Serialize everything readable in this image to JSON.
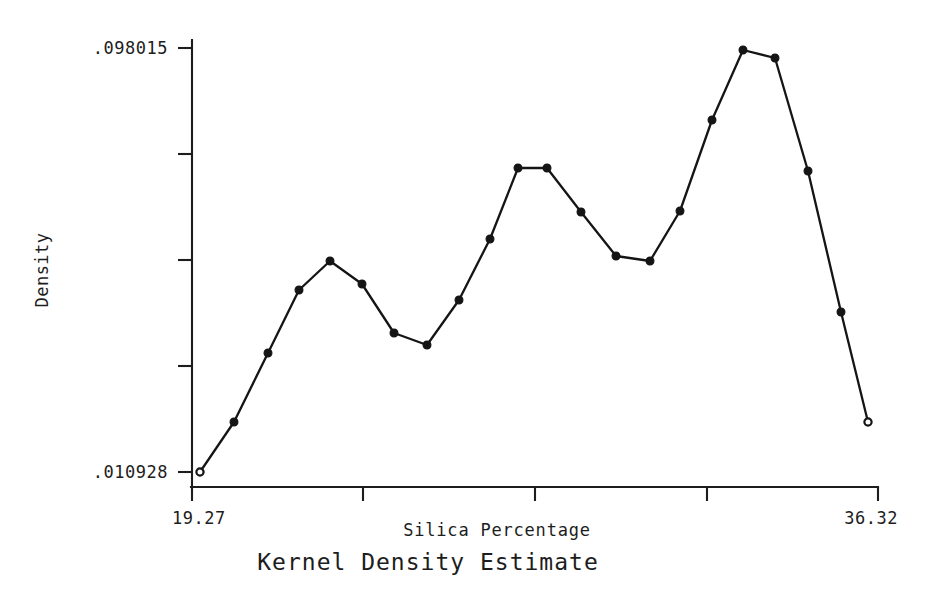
{
  "chart_data": {
    "type": "line",
    "title": "Kernel Density Estimate",
    "xlabel": "Silica Percentage",
    "ylabel": "Density",
    "xlim": [
      19.27,
      36.32
    ],
    "ylim": [
      0.010928,
      0.098015
    ],
    "x_tick_labels": [
      "19.27",
      "36.32"
    ],
    "y_tick_labels": [
      ".098015",
      ".010928"
    ],
    "x_tick_count": 5,
    "y_tick_count": 5,
    "grid": false,
    "legend": null,
    "marker": "filled-circle",
    "x": [
      19.27,
      20.11,
      20.96,
      21.73,
      22.5,
      23.3,
      24.07,
      24.89,
      25.67,
      26.46,
      27.36,
      28.11,
      28.83,
      29.63,
      30.48,
      31.28,
      32.11,
      32.92,
      33.7,
      34.5,
      35.27,
      36.32
    ],
    "y": [
      0.010928,
      0.021,
      0.035,
      0.048,
      0.054,
      0.048,
      0.039,
      0.036,
      0.0455,
      0.0575,
      0.07,
      0.07,
      0.0605,
      0.0555,
      0.0545,
      0.0605,
      0.0792,
      0.098,
      0.0963,
      0.0683,
      0.0444,
      0.0213
    ],
    "points_px": [
      [
        200,
        472
      ],
      [
        234,
        422
      ],
      [
        268,
        353
      ],
      [
        299,
        290
      ],
      [
        330,
        261
      ],
      [
        362,
        284
      ],
      [
        394,
        333
      ],
      [
        427,
        345
      ],
      [
        459,
        300
      ],
      [
        490,
        239
      ],
      [
        518,
        168
      ],
      [
        547,
        168
      ],
      [
        581,
        212
      ],
      [
        616,
        256
      ],
      [
        650,
        261
      ],
      [
        680,
        211
      ],
      [
        712,
        120
      ],
      [
        743,
        50
      ],
      [
        775,
        58
      ],
      [
        808,
        171
      ],
      [
        841,
        312
      ],
      [
        868,
        422
      ]
    ]
  },
  "axes": {
    "x_axis_label": "Silica Percentage",
    "y_axis_label": "Density",
    "x_min_label": "19.27",
    "x_max_label": "36.32",
    "y_min_label": ".010928",
    "y_max_label": ".098015"
  },
  "figure": {
    "title": "Kernel Density Estimate",
    "background_color": "#ffffff",
    "line_color": "#151515"
  }
}
